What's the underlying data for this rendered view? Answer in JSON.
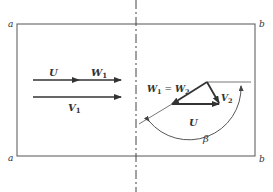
{
  "figure": {
    "corner_labels": {
      "top_left": "a",
      "bottom_left": "a",
      "top_right": "b",
      "bottom_right": "b"
    },
    "inlet": {
      "blade_speed": "U",
      "relative_velocity": "W",
      "relative_velocity_sub": "1",
      "absolute_velocity": "V",
      "absolute_velocity_sub": "1"
    },
    "outlet": {
      "relative_eq_left": "W",
      "relative_eq_left_sub": "1",
      "relative_eq_sign": " = ",
      "relative_eq_right": "W",
      "relative_eq_right_sub": "2",
      "absolute_velocity": "V",
      "absolute_velocity_sub": "2",
      "blade_speed": "U",
      "angle": "β"
    },
    "colors": {
      "line": "#333333",
      "background": "#ffffff"
    }
  }
}
